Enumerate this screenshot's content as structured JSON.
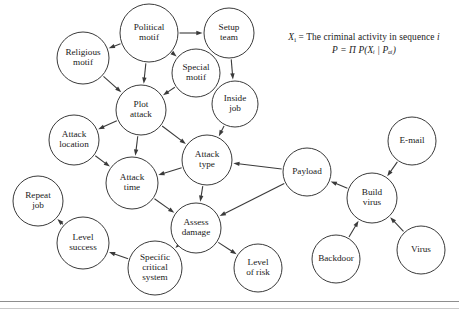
{
  "figure": {
    "type": "bayesian-network-diagram",
    "legend": {
      "line1_prefix": "X",
      "line1_sub": "i",
      "line1_text": " = The criminal activity in sequence ",
      "line1_italic_tail": "i",
      "line2": "P = Π P(Xᵢ | Pₐᵢ)"
    },
    "nodes": [
      {
        "id": "political-motif",
        "label": "Political motif",
        "lines": [
          "Political",
          "motif"
        ],
        "cx": 149,
        "cy": 33,
        "r": 29
      },
      {
        "id": "setup-team",
        "label": "Setup team",
        "lines": [
          "Setup",
          "team"
        ],
        "cx": 229,
        "cy": 33,
        "r": 25
      },
      {
        "id": "religious-motif",
        "label": "Religious motif",
        "lines": [
          "Religious",
          "motif"
        ],
        "cx": 83,
        "cy": 58,
        "r": 26
      },
      {
        "id": "special-motif",
        "label": "Special motif",
        "lines": [
          "Special",
          "motif"
        ],
        "cx": 196,
        "cy": 73,
        "r": 24
      },
      {
        "id": "plot-attack",
        "label": "Plot attack",
        "lines": [
          "Plot",
          "attack"
        ],
        "cx": 141,
        "cy": 110,
        "r": 25
      },
      {
        "id": "inside-job",
        "label": "Inside job",
        "lines": [
          "Inside",
          "job"
        ],
        "cx": 235,
        "cy": 104,
        "r": 23
      },
      {
        "id": "attack-location",
        "label": "Attack location",
        "lines": [
          "Attack",
          "location"
        ],
        "cx": 74,
        "cy": 140,
        "r": 25
      },
      {
        "id": "attack-type",
        "label": "Attack type",
        "lines": [
          "Attack",
          "type"
        ],
        "cx": 207,
        "cy": 160,
        "r": 25
      },
      {
        "id": "attack-time",
        "label": "Attack time",
        "lines": [
          "Attack",
          "time"
        ],
        "cx": 132,
        "cy": 183,
        "r": 26
      },
      {
        "id": "assess-damage",
        "label": "Assess damage",
        "lines": [
          "Assess",
          "damage"
        ],
        "cx": 196,
        "cy": 228,
        "r": 25
      },
      {
        "id": "payload",
        "label": "Payload",
        "lines": [
          "Payload"
        ],
        "cx": 307,
        "cy": 172,
        "r": 24
      },
      {
        "id": "build-virus",
        "label": "Build virus",
        "lines": [
          "Build",
          "virus"
        ],
        "cx": 372,
        "cy": 198,
        "r": 25
      },
      {
        "id": "e-mail",
        "label": "E-mail",
        "lines": [
          "E-mail"
        ],
        "cx": 412,
        "cy": 141,
        "r": 24
      },
      {
        "id": "virus",
        "label": "Virus",
        "lines": [
          "Virus"
        ],
        "cx": 421,
        "cy": 250,
        "r": 24
      },
      {
        "id": "backdoor",
        "label": "Backdoor",
        "lines": [
          "Backdoor"
        ],
        "cx": 336,
        "cy": 259,
        "r": 24
      },
      {
        "id": "level-of-risk",
        "label": "Level of risk",
        "lines": [
          "Level",
          "of risk"
        ],
        "cx": 258,
        "cy": 268,
        "r": 24
      },
      {
        "id": "specific-critical-system",
        "label": "Specific critical system",
        "lines": [
          "Specific",
          "critical",
          "system"
        ],
        "cx": 155,
        "cy": 268,
        "r": 27
      },
      {
        "id": "level-success",
        "label": "Level success",
        "lines": [
          "Level",
          "success"
        ],
        "cx": 83,
        "cy": 243,
        "r": 26
      },
      {
        "id": "repeat-job",
        "label": "Repeat job",
        "lines": [
          "Repeat",
          "job"
        ],
        "cx": 38,
        "cy": 201,
        "r": 25
      }
    ],
    "edges": [
      {
        "from": "political-motif",
        "to": "religious-motif"
      },
      {
        "from": "political-motif",
        "to": "setup-team"
      },
      {
        "from": "political-motif",
        "to": "special-motif"
      },
      {
        "from": "political-motif",
        "to": "plot-attack"
      },
      {
        "from": "religious-motif",
        "to": "plot-attack"
      },
      {
        "from": "special-motif",
        "to": "plot-attack"
      },
      {
        "from": "setup-team",
        "to": "inside-job"
      },
      {
        "from": "inside-job",
        "to": "attack-type"
      },
      {
        "from": "plot-attack",
        "to": "attack-location"
      },
      {
        "from": "plot-attack",
        "to": "attack-time"
      },
      {
        "from": "plot-attack",
        "to": "attack-type"
      },
      {
        "from": "attack-location",
        "to": "attack-time"
      },
      {
        "from": "attack-type",
        "to": "attack-time"
      },
      {
        "from": "attack-type",
        "to": "assess-damage"
      },
      {
        "from": "attack-time",
        "to": "assess-damage"
      },
      {
        "from": "payload",
        "to": "attack-type"
      },
      {
        "from": "payload",
        "to": "assess-damage"
      },
      {
        "from": "build-virus",
        "to": "payload"
      },
      {
        "from": "e-mail",
        "to": "build-virus"
      },
      {
        "from": "virus",
        "to": "build-virus"
      },
      {
        "from": "backdoor",
        "to": "build-virus"
      },
      {
        "from": "assess-damage",
        "to": "specific-critical-system"
      },
      {
        "from": "assess-damage",
        "to": "level-of-risk"
      },
      {
        "from": "specific-critical-system",
        "to": "level-success"
      },
      {
        "from": "level-success",
        "to": "repeat-job"
      }
    ],
    "colors": {
      "stroke": "#3a3a3a",
      "node_fill": "#ffffff",
      "text": "#1a1a1a",
      "rule": "#8e8e8e"
    }
  }
}
